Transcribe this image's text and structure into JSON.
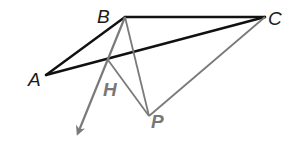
{
  "diagram": {
    "colors": {
      "black": "#111111",
      "gray": "#7a7a7a",
      "label_black": "#1a1a1a",
      "label_gray": "#777777"
    },
    "points": {
      "A": {
        "label": "A",
        "x": 46,
        "y": 75
      },
      "B": {
        "label": "B",
        "x": 125,
        "y": 17
      },
      "C": {
        "label": "C",
        "x": 265,
        "y": 17
      },
      "H": {
        "label": "H",
        "x": 108,
        "y": 60
      },
      "P": {
        "label": "P",
        "x": 149,
        "y": 116
      }
    },
    "labels": {
      "A": "A",
      "B": "B",
      "C": "C",
      "H": "H",
      "P": "P"
    },
    "segments": [
      {
        "from": "A",
        "to": "B",
        "style": "black"
      },
      {
        "from": "B",
        "to": "C",
        "style": "black"
      },
      {
        "from": "A",
        "to": "C",
        "style": "black"
      },
      {
        "from": "B",
        "to": "P",
        "style": "gray"
      },
      {
        "from": "H",
        "to": "P",
        "style": "gray"
      },
      {
        "from": "P",
        "to": "C",
        "style": "gray"
      }
    ],
    "ray": {
      "from": "B",
      "through": "H",
      "arrow_tip": {
        "x": 76,
        "y": 138
      },
      "style": "gray"
    }
  }
}
